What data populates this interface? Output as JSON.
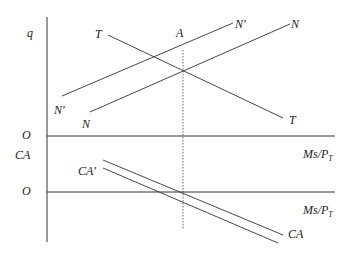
{
  "diagram": {
    "type": "economics-two-panel",
    "upper_panel": {
      "y_axis_label": "q",
      "x_axis_origin_label": "O",
      "x_axis_label": "Ms/P",
      "x_axis_label_subscript": "T",
      "curves": [
        {
          "id": "T",
          "start_label": "T",
          "end_label": "T",
          "slope": "downward"
        },
        {
          "id": "N_prime",
          "start_label": "N'",
          "end_label": "N'",
          "slope": "upward"
        },
        {
          "id": "N",
          "start_label": "N",
          "end_label": "N",
          "slope": "upward"
        }
      ],
      "point_label": "A"
    },
    "lower_panel": {
      "y_axis_label": "CA",
      "x_axis_origin_label": "O",
      "x_axis_label": "Ms/P",
      "x_axis_label_subscript": "T",
      "curves": [
        {
          "id": "CA",
          "end_label": "CA",
          "slope": "downward"
        },
        {
          "id": "CA_prime",
          "start_label": "CA'",
          "slope": "downward"
        }
      ]
    },
    "guide_line": {
      "style": "dotted",
      "orientation": "vertical",
      "through": "A"
    }
  }
}
